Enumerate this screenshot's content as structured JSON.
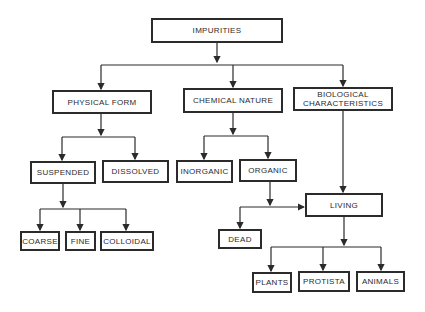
{
  "diagram": {
    "type": "tree",
    "colors": {
      "line": "#2b2b2b",
      "background": "#ffffff"
    },
    "nodes": {
      "impurities": "IMPURITIES",
      "physical_form": "PHYSICAL FORM",
      "chemical_nature": "CHEMICAL NATURE",
      "biological_line1": "BIOLOGICAL",
      "biological_line2": "CHARACTERISTICS",
      "suspended": "SUSPENDED",
      "dissolved": "DISSOLVED",
      "inorganic": "INORGANIC",
      "organic": "ORGANIC",
      "living": "LIVING",
      "dead": "DEAD",
      "coarse": "COARSE",
      "fine": "FINE",
      "colloidal": "COLLOIDAL",
      "plants": "PLANTS",
      "protista": "PROTISTA",
      "animals": "ANIMALS"
    },
    "edges": [
      [
        "IMPURITIES",
        "PHYSICAL FORM"
      ],
      [
        "IMPURITIES",
        "CHEMICAL NATURE"
      ],
      [
        "IMPURITIES",
        "BIOLOGICAL CHARACTERISTICS"
      ],
      [
        "PHYSICAL FORM",
        "SUSPENDED"
      ],
      [
        "PHYSICAL FORM",
        "DISSOLVED"
      ],
      [
        "CHEMICAL NATURE",
        "INORGANIC"
      ],
      [
        "CHEMICAL NATURE",
        "ORGANIC"
      ],
      [
        "SUSPENDED",
        "COARSE"
      ],
      [
        "SUSPENDED",
        "FINE"
      ],
      [
        "SUSPENDED",
        "COLLOIDAL"
      ],
      [
        "BIOLOGICAL CHARACTERISTICS",
        "LIVING"
      ],
      [
        "ORGANIC",
        "LIVING"
      ],
      [
        "ORGANIC",
        "DEAD"
      ],
      [
        "LIVING",
        "PLANTS"
      ],
      [
        "LIVING",
        "PROTISTA"
      ],
      [
        "LIVING",
        "ANIMALS"
      ]
    ]
  }
}
